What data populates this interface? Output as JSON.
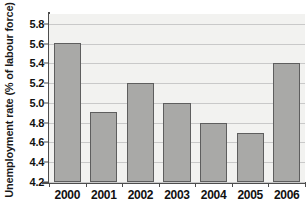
{
  "chart_data": {
    "type": "bar",
    "title": "",
    "xlabel": "",
    "ylabel": "Unemployment rate (% of labour force)",
    "categories": [
      "2000",
      "2001",
      "2002",
      "2003",
      "2004",
      "2005",
      "2006"
    ],
    "values": [
      5.61,
      4.91,
      5.2,
      5.0,
      4.8,
      4.7,
      5.4
    ],
    "series": [
      {
        "name": "Unemployment rate",
        "values": [
          5.61,
          4.91,
          5.2,
          5.0,
          4.8,
          4.7,
          5.4
        ]
      }
    ],
    "ylim": [
      4.2,
      5.9
    ],
    "ytick_labels": [
      "5.8",
      "5.6",
      "5.4",
      "5.2",
      "5.0",
      "4.8",
      "4.6",
      "4.4",
      "4.2"
    ],
    "ytick_values": [
      5.8,
      5.6,
      5.4,
      5.2,
      5.0,
      4.8,
      4.6,
      4.4,
      4.2
    ],
    "grid": true,
    "legend": "none",
    "bar_color": "#a9a9a7",
    "bar_border_color": "#5e5e5e",
    "plot_background": "#f2f2f0",
    "gridline_color": "#c9c9c9",
    "axis_color": "#4d4d4d",
    "text_color": "#111111"
  }
}
